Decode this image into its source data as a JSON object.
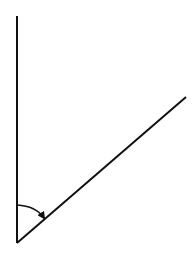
{
  "diagram": {
    "type": "angle",
    "stroke_color": "#111111",
    "vertex": [
      17,
      243
    ],
    "ray_vertical_end": [
      17,
      16
    ],
    "ray_diagonal_end": [
      186,
      97
    ],
    "arc": {
      "start": [
        17,
        205
      ],
      "end": [
        45,
        219
      ],
      "arrow": true
    }
  }
}
